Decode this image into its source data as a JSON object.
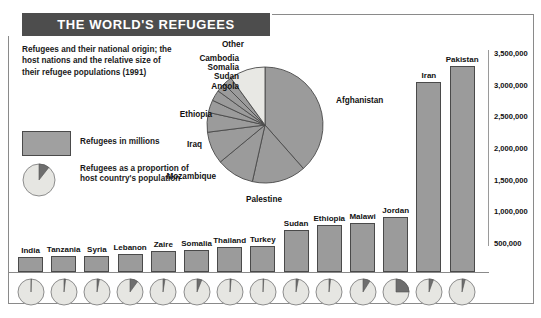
{
  "title": "THE WORLD'S REFUGEES",
  "subtitle": "Refugees and their national origin; the host nations and the relative size of their refugee populations (1991)",
  "legend": {
    "bar_label": "Refugees in millions",
    "pie_label": "Refugees as a proportion of host country's population"
  },
  "colors": {
    "title_bar": "#4d4d4d",
    "bar_fill": "#9b9b9b",
    "pie_slice": "#9b9b9b",
    "pie_other": "#e8e8e4",
    "pie_outline": "#4a4a4a",
    "host_pie_base": "#e6e6e2",
    "host_pie_wedge": "#6e6e6e",
    "text": "#111111"
  },
  "chart_data": [
    {
      "type": "pie",
      "title": "Refugees by national origin",
      "labels": [
        "Afghanistan",
        "Palestine",
        "Mozambique",
        "Iraq",
        "Ethiopia",
        "Angola",
        "Sudan",
        "Somalia",
        "Cambodia",
        "Other"
      ],
      "values": [
        38.5,
        15.0,
        10.5,
        9.0,
        5.5,
        3.5,
        3.0,
        2.5,
        2.5,
        10.0
      ],
      "start_angle": 0,
      "legend": "none"
    },
    {
      "type": "bar",
      "title": "Refugees in millions by host country",
      "categories": [
        "India",
        "Tanzania",
        "Syria",
        "Lebanon",
        "Zaire",
        "Somalia",
        "Thailand",
        "Turkey",
        "Sudan",
        "Ethiopia",
        "Malawi",
        "Jordan",
        "Iran",
        "Pakistan"
      ],
      "values": [
        285000,
        290000,
        300000,
        320000,
        380000,
        385000,
        440000,
        450000,
        700000,
        790000,
        820000,
        905000,
        3050000,
        3290000
      ],
      "ylabel": "",
      "xlabel": "",
      "ylim": [
        0,
        3750000
      ],
      "yticks": [
        500000,
        1000000,
        1500000,
        2000000,
        2500000,
        3000000,
        3500000
      ],
      "ytick_labels": [
        "500,000",
        "1,000,000",
        "1,500,000",
        "2,000,000",
        "2,500,000",
        "3,000,000",
        "3,500,000"
      ],
      "grid": false
    },
    {
      "type": "pie",
      "title": "Refugees as a proportion of host country's population",
      "categories": [
        "India",
        "Tanzania",
        "Syria",
        "Lebanon",
        "Zaire",
        "Somalia",
        "Thailand",
        "Turkey",
        "Sudan",
        "Ethiopia",
        "Malawi",
        "Jordan",
        "Iran",
        "Pakistan"
      ],
      "values": [
        0.5,
        2.0,
        3.0,
        10.0,
        2.5,
        6.0,
        1.5,
        1.0,
        3.0,
        2.0,
        9.0,
        25.0,
        5.5,
        4.0
      ]
    }
  ]
}
